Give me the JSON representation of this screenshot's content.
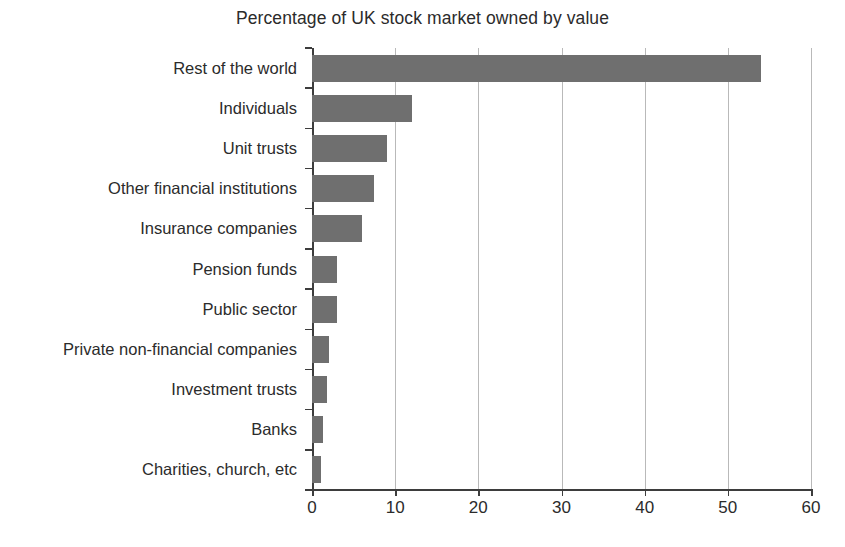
{
  "chart_data": {
    "type": "bar",
    "orientation": "horizontal",
    "title": "Percentage of UK stock market owned by value",
    "xlabel": "",
    "ylabel": "",
    "xlim": [
      0,
      60
    ],
    "xticks": [
      0,
      10,
      20,
      30,
      40,
      50,
      60
    ],
    "xtick_labels": [
      "0",
      "10",
      "20",
      "30",
      "40",
      "50",
      "60"
    ],
    "grid": "vertical",
    "legend": "none",
    "bar_color": "#6f6f6f",
    "axis_color": "#3d3d3d",
    "gridline_color": "#b9b9b9",
    "categories": [
      "Rest of the world",
      "Individuals",
      "Unit trusts",
      "Other financial institutions",
      "Insurance companies",
      "Pension funds",
      "Public sector",
      "Private non-financial companies",
      "Investment trusts",
      "Banks",
      "Charities, church, etc"
    ],
    "values": [
      54,
      12,
      9,
      7.5,
      6,
      3,
      3,
      2,
      1.8,
      1.3,
      1.1
    ]
  }
}
